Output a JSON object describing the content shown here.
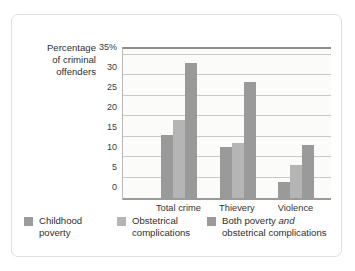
{
  "chart_data": {
    "type": "bar",
    "title": "",
    "xlabel": "",
    "ylabel": "Percentage of criminal offenders",
    "categories": [
      "Total crime",
      "Thievery",
      "Violence"
    ],
    "series": [
      {
        "name": "Childhood poverty",
        "values": [
          15.5,
          12.5,
          3.8
        ]
      },
      {
        "name": "Obstetrical complications",
        "values": [
          19,
          13.5,
          8
        ]
      },
      {
        "name": "Both poverty and obstetrical complications",
        "values": [
          33,
          28.5,
          13
        ]
      }
    ],
    "ylim": [
      0,
      35
    ],
    "yticks": [
      "35%",
      "30",
      "25",
      "20",
      "15",
      "10",
      "5",
      "0"
    ],
    "ytick_values": [
      35,
      30,
      25,
      20,
      15,
      10,
      5,
      0
    ],
    "grid": true,
    "legend_position": "bottom",
    "colors": [
      "#9a9a9a",
      "#b5b5b5",
      "#9a9a9a"
    ]
  },
  "axis": {
    "title_line1": "Percentage",
    "title_line2": "of criminal",
    "title_line3": "offenders"
  },
  "legend": [
    {
      "line1": "Childhood",
      "line2": "poverty"
    },
    {
      "line1": "Obstetrical",
      "line2": "complications"
    },
    {
      "line1_a": "Both poverty ",
      "line1_em": "and",
      "line2": "obstetrical complications"
    }
  ]
}
